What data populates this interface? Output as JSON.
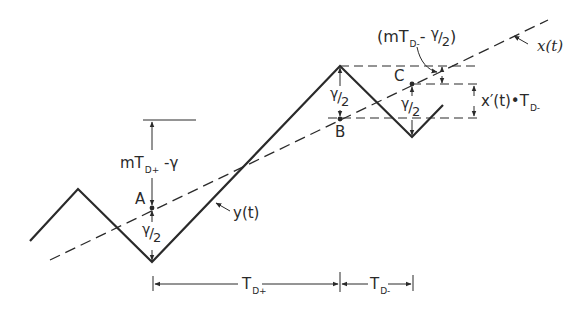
{
  "figure": {
    "type": "waveform-diagram",
    "signals": {
      "output": {
        "label": "y(t)",
        "style": "solid"
      },
      "input": {
        "label": "x(t)",
        "style": "dashed"
      }
    },
    "points": {
      "a": "A",
      "b": "B",
      "c": "C"
    },
    "annotations": {
      "m_td_plus_minus_gamma": {
        "pre": "mT",
        "sub": "D+",
        "post": " -γ"
      },
      "gamma_half_a": {
        "num": "γ",
        "den": "2"
      },
      "gamma_half_b": {
        "num": "γ",
        "den": "2"
      },
      "gamma_half_c": {
        "num": "γ",
        "den": "2"
      },
      "m_td_minus_minus_gamma_half": {
        "open": "(mT",
        "sub": "D-",
        "mid": "- ",
        "num": "γ",
        "den": "2",
        "close": ")"
      },
      "x_prime_t_td_minus": {
        "pre": "x′(t)•T",
        "sub": "D-"
      }
    },
    "dimensions": {
      "td_plus": {
        "pre": "T",
        "sub": "D+"
      },
      "td_minus": {
        "pre": "T",
        "sub": "D-"
      }
    },
    "colors": {
      "ink": "#2a2a2a",
      "background": "#ffffff"
    }
  }
}
